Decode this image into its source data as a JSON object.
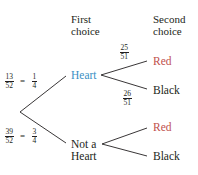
{
  "headers": {
    "first": [
      "First",
      "choice"
    ],
    "second": [
      "Second",
      "choice"
    ]
  },
  "root_probabilities": {
    "heart": {
      "num": "13",
      "den": "52",
      "eq": "=",
      "simp_num": "1",
      "simp_den": "4"
    },
    "not_heart": {
      "num": "39",
      "den": "52",
      "eq": "=",
      "simp_num": "3",
      "simp_den": "4"
    }
  },
  "first_choice": {
    "heart": "Heart",
    "not_heart": [
      "Not a",
      "Heart"
    ]
  },
  "heart_branch_probabilities": {
    "red": {
      "num": "25",
      "den": "51"
    },
    "black": {
      "num": "26",
      "den": "51"
    }
  },
  "second_choice": {
    "heart_red": "Red",
    "heart_black": "Black",
    "notheart_red": "Red",
    "notheart_black": "Black"
  },
  "colors": {
    "heart": "#3a8fc4",
    "red": "#c0504d",
    "text": "#231f20",
    "line": "#231f20"
  }
}
